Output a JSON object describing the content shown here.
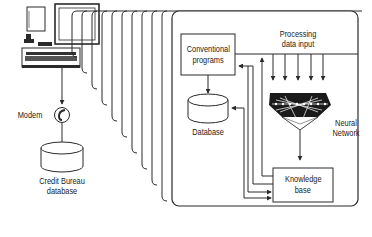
{
  "diagram": {
    "type": "system-architecture",
    "style": {
      "line_color": "#2a2a2a",
      "background": "#ffffff",
      "fill_dark": "#1a1a1a"
    },
    "nodes": {
      "computer": {
        "icon": "computer-terminal-icon"
      },
      "modem": {
        "label": "Modem",
        "icon": "telephone-icon"
      },
      "credit_bureau": {
        "line1": "Credit Bureau",
        "line2": "database",
        "icon": "database-cylinder-icon"
      },
      "conventional_programs": {
        "line1": "Conventional",
        "line2": "programs"
      },
      "database": {
        "label": "Database",
        "icon": "database-cylinder-icon"
      },
      "processing_input": {
        "line1": "Processing",
        "line2": "data input",
        "arrow_count": 5
      },
      "neural_network": {
        "line1": "Neural",
        "line2": "Network",
        "icon": "neural-network-icon"
      },
      "knowledge_base": {
        "line1": "Knowledge",
        "line2": "base"
      }
    },
    "stacked_pages": {
      "count": 10
    },
    "edges": [
      {
        "from": "computer",
        "to": "modem"
      },
      {
        "from": "modem",
        "to": "credit_bureau"
      },
      {
        "from": "conventional_programs",
        "to": "database"
      },
      {
        "from": "processing_input",
        "to": "neural_network"
      },
      {
        "from": "neural_network",
        "to": "knowledge_base"
      },
      {
        "from": "knowledge_base",
        "to": "conventional_programs"
      },
      {
        "from": "knowledge_base",
        "to": "database"
      },
      {
        "from": "conventional_programs",
        "to": "knowledge_base"
      },
      {
        "from": "database",
        "to": "knowledge_base"
      },
      {
        "from": "knowledge_base",
        "to": "processing_input"
      }
    ]
  }
}
